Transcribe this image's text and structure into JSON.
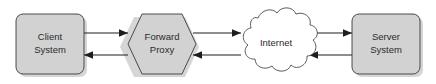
{
  "diagram": {
    "type": "network-flow-diagram",
    "background_color": "#ffffff",
    "node_fill_color": "#d2d2d2",
    "node_border_color": "#3a3a3a",
    "cloud_fill_color": "#ffffff",
    "arrow_color": "#1e1e1e",
    "text_color": "#2b2b2b",
    "nodes": [
      {
        "id": "client",
        "shape": "rounded-rectangle",
        "label_line1": "Client",
        "label_line2": "System"
      },
      {
        "id": "forward-proxy",
        "shape": "hexagon",
        "label_line1": "Forward",
        "label_line2": "Proxy"
      },
      {
        "id": "internet",
        "shape": "cloud",
        "label_line1": "Internet",
        "label_line2": ""
      },
      {
        "id": "server",
        "shape": "rounded-rectangle",
        "label_line1": "Server",
        "label_line2": "System"
      }
    ],
    "connections": [
      {
        "id": "client-to-proxy",
        "from": "client",
        "to": "forward-proxy",
        "direction": "right"
      },
      {
        "id": "proxy-to-client",
        "from": "forward-proxy",
        "to": "client",
        "direction": "left"
      },
      {
        "id": "proxy-to-internet",
        "from": "forward-proxy",
        "to": "internet",
        "direction": "right"
      },
      {
        "id": "internet-to-proxy",
        "from": "internet",
        "to": "forward-proxy",
        "direction": "left"
      },
      {
        "id": "internet-to-server",
        "from": "internet",
        "to": "server",
        "direction": "right"
      },
      {
        "id": "server-to-internet",
        "from": "server",
        "to": "internet",
        "direction": "left"
      }
    ]
  }
}
